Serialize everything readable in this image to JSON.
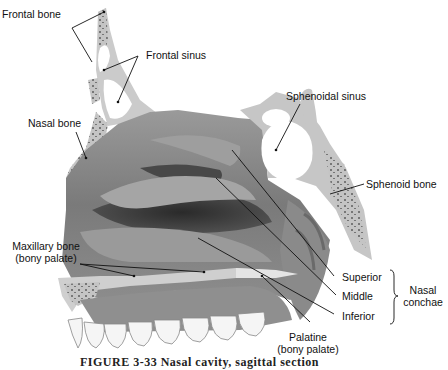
{
  "figure": {
    "caption": "FIGURE 3-33  Nasal cavity, sagittal section",
    "labels": {
      "frontal_bone": "Frontal bone",
      "frontal_sinus": "Frontal sinus",
      "nasal_bone": "Nasal bone",
      "sphenoidal_sinus": "Sphenoidal sinus",
      "sphenoid_bone": "Sphenoid bone",
      "maxillary_bone_1": "Maxillary bone",
      "maxillary_bone_2": "(bony palate)",
      "superior": "Superior",
      "middle": "Middle",
      "inferior": "Inferior",
      "nasal_conchae_1": "Nasal",
      "nasal_conchae_2": "conchae",
      "palatine_1": "Palatine",
      "palatine_2": "(bony palate)"
    },
    "colors": {
      "bone": "#c8c8c8",
      "tissue_light": "#a8a8a8",
      "tissue_dark": "#3a3a3a",
      "teeth": "#f4f4f4",
      "leader": "#111111"
    }
  }
}
